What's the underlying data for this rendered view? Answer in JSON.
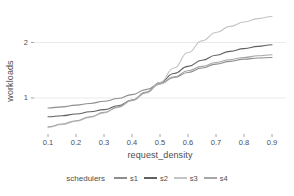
{
  "chart_data": {
    "type": "line",
    "title": "",
    "xlabel": "request_density",
    "ylabel": "workloads",
    "legend_title": "schedulers",
    "legend_position": "bottom",
    "grid": true,
    "xlim": [
      0.05,
      0.95
    ],
    "ylim": [
      0.35,
      2.55
    ],
    "xticks": [
      "0.1",
      "0.2",
      "0.3",
      "0.4",
      "0.5",
      "0.6",
      "0.7",
      "0.8",
      "0.9"
    ],
    "xtick_values": [
      0.1,
      0.2,
      0.3,
      0.4,
      0.5,
      0.6,
      0.7,
      0.8,
      0.9
    ],
    "yticks": [
      "1",
      "2"
    ],
    "ytick_values": [
      1,
      2
    ],
    "x": [
      0.1,
      0.15,
      0.2,
      0.25,
      0.3,
      0.35,
      0.4,
      0.45,
      0.5,
      0.55,
      0.6,
      0.65,
      0.7,
      0.75,
      0.8,
      0.85,
      0.9
    ],
    "series": [
      {
        "name": "s1",
        "color": "#8d8d8d",
        "values": [
          0.82,
          0.84,
          0.87,
          0.9,
          0.94,
          0.99,
          1.06,
          1.15,
          1.26,
          1.37,
          1.46,
          1.54,
          1.61,
          1.66,
          1.7,
          1.72,
          1.73
        ]
      },
      {
        "name": "s2",
        "color": "#606060",
        "values": [
          0.66,
          0.68,
          0.71,
          0.75,
          0.79,
          0.86,
          0.96,
          1.1,
          1.28,
          1.44,
          1.57,
          1.68,
          1.77,
          1.84,
          1.89,
          1.93,
          1.96
        ]
      },
      {
        "name": "s3",
        "color": "#c4c4c4",
        "values": [
          0.47,
          0.52,
          0.58,
          0.65,
          0.73,
          0.83,
          0.95,
          1.09,
          1.28,
          1.54,
          1.82,
          2.03,
          2.18,
          2.29,
          2.37,
          2.43,
          2.47
        ]
      },
      {
        "name": "s4",
        "color": "#a6a6a6",
        "values": [
          0.48,
          0.53,
          0.59,
          0.66,
          0.74,
          0.84,
          0.96,
          1.1,
          1.25,
          1.38,
          1.49,
          1.57,
          1.64,
          1.69,
          1.73,
          1.76,
          1.78
        ]
      }
    ]
  },
  "plot": {
    "panel_bg": "#ffffff",
    "grid_color": "#ebebeb",
    "text_color": "#4d4d4d"
  }
}
